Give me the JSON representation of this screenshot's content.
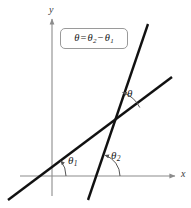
{
  "figure": {
    "type": "geometry-diagram",
    "background_color": "#ffffff",
    "width": 191,
    "height": 208
  },
  "axes": {
    "x_label": "x",
    "y_label": "y",
    "axis_color": "#8c8c8c",
    "origin": {
      "x": 52,
      "y": 176
    },
    "x_axis": {
      "start_x": 20,
      "end_x": 178,
      "y": 176,
      "arrow": "right"
    },
    "y_axis": {
      "x": 52,
      "start_y": 196,
      "end_y": 16,
      "arrow": "up"
    }
  },
  "formula": {
    "theta": "θ",
    "equals": "=",
    "theta2": "θ",
    "sub2": "2",
    "minus": "−",
    "theta1": "θ",
    "sub1": "1",
    "full_text": "θ = θ₂ − θ₁",
    "border_color": "#9a9a9a"
  },
  "lines": [
    {
      "name": "line-1-shallow",
      "label": "line with angle theta-1",
      "color": "#111111",
      "x1": 8,
      "y1": 200,
      "x2": 172,
      "y2": 77,
      "stroke_width": 2.4
    },
    {
      "name": "line-2-steep",
      "label": "line with angle theta-2",
      "color": "#111111",
      "x1": 88,
      "y1": 200,
      "x2": 148,
      "y2": 24,
      "stroke_width": 2.4
    }
  ],
  "intersection": {
    "x": 113,
    "y": 121
  },
  "angles": [
    {
      "name": "theta-1",
      "symbol": "θ",
      "subscript": "1",
      "label_x": 68,
      "label_y": 155,
      "vertex_x": 42,
      "vertex_y": 176,
      "arc_radius": 24,
      "arc_color": "#555555",
      "description": "angle of inclination of shallow line with x-axis"
    },
    {
      "name": "theta-2",
      "symbol": "θ",
      "subscript": "2",
      "label_x": 111,
      "label_y": 150,
      "vertex_x": 98,
      "vertex_y": 176,
      "arc_radius": 22,
      "arc_color": "#555555",
      "description": "angle of inclination of steep line with x-axis"
    },
    {
      "name": "theta",
      "symbol": "θ",
      "subscript": "",
      "label_x": 127,
      "label_y": 88,
      "vertex_x": 113,
      "vertex_y": 121,
      "arc_radius": 30,
      "arc_color": "#555555",
      "description": "angle between the two lines at their intersection"
    }
  ]
}
